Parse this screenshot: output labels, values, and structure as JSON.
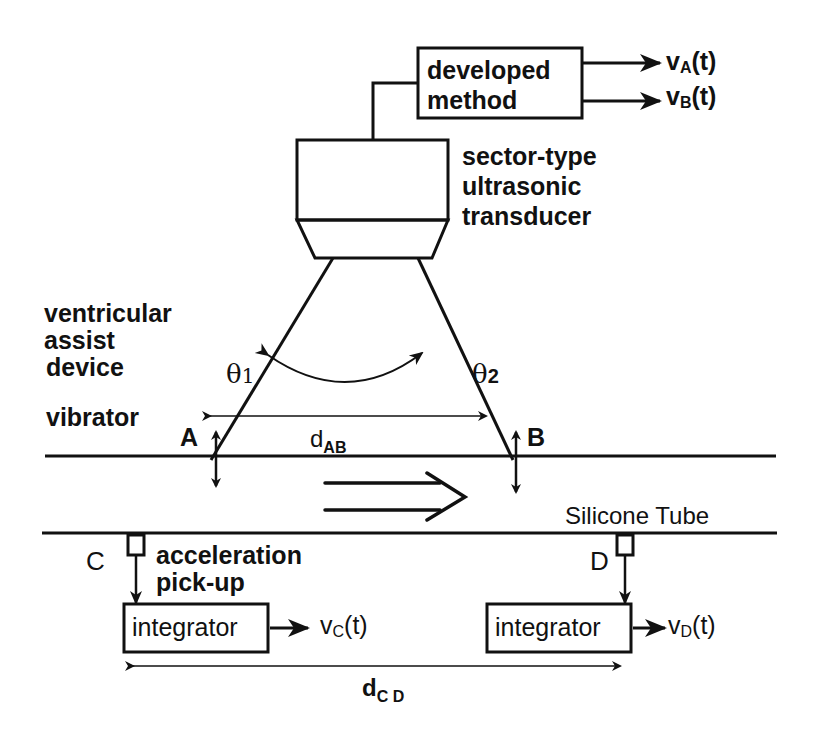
{
  "diagram": {
    "blocks": {
      "developed_method": {
        "line1": "developed",
        "line2": "method"
      },
      "integrator_c": "integrator",
      "integrator_d": "integrator"
    },
    "outputs": {
      "va": {
        "base": "v",
        "sub": "A",
        "tail": "(t)"
      },
      "vb": {
        "base": "v",
        "sub": "B",
        "tail": "(t)"
      },
      "vc": {
        "base": "v",
        "sub": "C",
        "tail": "(t)"
      },
      "vd": {
        "base": "v",
        "sub": "D",
        "tail": "(t)"
      }
    },
    "labels": {
      "transducer": [
        "sector-type",
        "ultrasonic",
        "transducer"
      ],
      "vad": [
        "ventricular",
        "assist",
        "device"
      ],
      "vibrator": "vibrator",
      "theta1": {
        "base": "θ",
        "sub": "1"
      },
      "theta2": {
        "base": "θ",
        "sub": "2"
      },
      "point_a": "A",
      "point_b": "B",
      "point_c": "C",
      "point_d": "D",
      "dab": {
        "base": "d",
        "sub": "AB"
      },
      "dcd": {
        "base": "d",
        "sub": "C D"
      },
      "silicone_tube": "Silicone Tube",
      "pickup": [
        "acceleration",
        "pick-up"
      ]
    },
    "colors": {
      "ink": "#111111",
      "background": "#ffffff"
    }
  }
}
